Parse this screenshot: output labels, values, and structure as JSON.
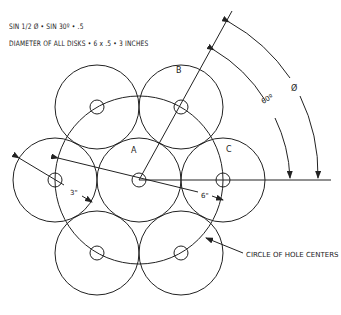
{
  "notes": {
    "line1": "SIN  1/2 Ø • SIN  30º  •  .5",
    "line2": "DIAMETER OF ALL DISKS • 6 x .5 • 3 INCHES"
  },
  "labels": {
    "disk_a": "A",
    "disk_b": "B",
    "disk_c": "C",
    "dim_3in": "3\"",
    "dim_6in": "6\"",
    "angle_60": "60º",
    "angle_phi": "Ø",
    "callout_circle": "CIRCLE OF HOLE CENTERS"
  },
  "geometry": {
    "center": [
      139,
      180
    ],
    "disk_radius": 42,
    "hole_radius": 7,
    "hole_circle_radius": 84,
    "disk_count": 7,
    "angle_deg": 60
  },
  "colors": {
    "line": "#222222",
    "background": "#ffffff"
  }
}
